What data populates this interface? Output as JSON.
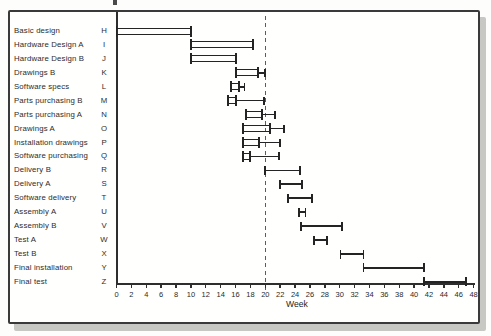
{
  "colors": {
    "ink": "#242424",
    "axis": "#2e2e2e",
    "frame_border": "#3a3a3a",
    "shadow": "#c7c7c4",
    "background": "#fffffe",
    "dashed_line": "#5c5c5c"
  },
  "chart_data": {
    "type": "bar",
    "subtype": "gantt-horizontal",
    "title": "",
    "xlabel": "Week",
    "ylabel": "",
    "xlim": [
      0,
      48
    ],
    "x_ticks": [
      0,
      2,
      4,
      6,
      8,
      10,
      12,
      14,
      16,
      18,
      20,
      22,
      24,
      26,
      28,
      30,
      32,
      34,
      36,
      38,
      40,
      42,
      44,
      46,
      48
    ],
    "time_now_week": 20,
    "grid": false,
    "legend": false,
    "bar_style_meaning": {
      "hollow": "double-line open bar with end brackets (tasks started/finished before time-now)",
      "ibeam": "thin line with end ticks (future tasks)",
      "slack": "thin trailing line with end tick (float after hollow bar)"
    },
    "tasks": [
      {
        "label": "Basic design",
        "code": "H",
        "style": "hollow",
        "start": 0,
        "end": 10,
        "slack_end": null
      },
      {
        "label": "Hardware Design A",
        "code": "I",
        "style": "hollow",
        "start": 10,
        "end": 18.3,
        "slack_end": null
      },
      {
        "label": "Hardware Design B",
        "code": "J",
        "style": "hollow",
        "start": 10,
        "end": 16,
        "slack_end": null
      },
      {
        "label": "Drawings B",
        "code": "K",
        "style": "hollow",
        "start": 16,
        "end": 19,
        "slack_end": 20
      },
      {
        "label": "Software specs",
        "code": "L",
        "style": "hollow",
        "start": 15.4,
        "end": 16.5,
        "slack_end": 17.2
      },
      {
        "label": "Parts purchasing B",
        "code": "M",
        "style": "hollow",
        "start": 15,
        "end": 16,
        "slack_end": 19.8
      },
      {
        "label": "Parts purchasing A",
        "code": "N",
        "style": "hollow",
        "start": 17.4,
        "end": 19.6,
        "slack_end": 21.3
      },
      {
        "label": "Drawings A",
        "code": "O",
        "style": "hollow",
        "start": 17,
        "end": 20.6,
        "slack_end": 22.5
      },
      {
        "label": "Installation drawings",
        "code": "P",
        "style": "hollow",
        "start": 17,
        "end": 19.1,
        "slack_end": 22
      },
      {
        "label": "Software purchasing",
        "code": "Q",
        "style": "hollow",
        "start": 17,
        "end": 17.9,
        "slack_end": 21.8
      },
      {
        "label": "Delivery B",
        "code": "R",
        "style": "ibeam",
        "start": 20,
        "end": 24.7,
        "slack_end": null
      },
      {
        "label": "Delivery A",
        "code": "S",
        "style": "ibeam",
        "start": 22,
        "end": 24.9,
        "slack_end": null
      },
      {
        "label": "Software delivery",
        "code": "T",
        "style": "ibeam",
        "start": 23.1,
        "end": 26.3,
        "slack_end": null
      },
      {
        "label": "Assembly A",
        "code": "U",
        "style": "ibeam",
        "start": 24.5,
        "end": 25.4,
        "slack_end": null
      },
      {
        "label": "Assembly B",
        "code": "V",
        "style": "ibeam",
        "start": 24.8,
        "end": 30.3,
        "slack_end": null
      },
      {
        "label": "Test A",
        "code": "W",
        "style": "ibeam",
        "start": 26.5,
        "end": 28.3,
        "slack_end": null
      },
      {
        "label": "Test B",
        "code": "X",
        "style": "ibeam",
        "start": 30.1,
        "end": 33.2,
        "slack_end": null
      },
      {
        "label": "Final installation",
        "code": "Y",
        "style": "ibeam",
        "start": 33.2,
        "end": 41.3,
        "slack_end": null
      },
      {
        "label": "Final test",
        "code": "Z",
        "style": "ibeam",
        "start": 41.3,
        "end": 47,
        "slack_end": null
      }
    ]
  }
}
